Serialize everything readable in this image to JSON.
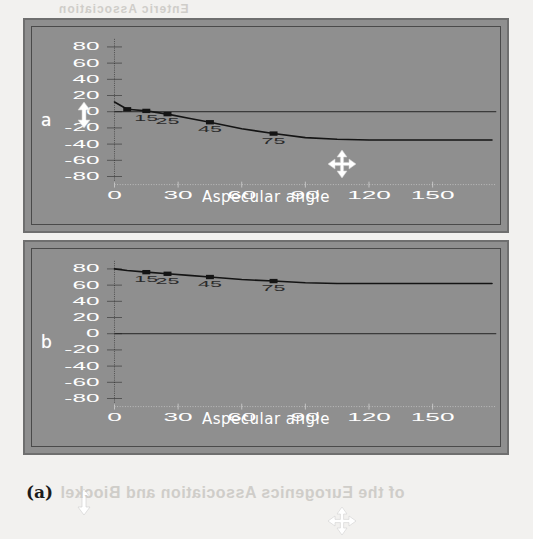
{
  "caption": "(a)",
  "bleed_through": {
    "top": "Enteric Association",
    "bottom": "of the Eurogenics Association and Biockel"
  },
  "panels": [
    {
      "id": "a",
      "letter": "a",
      "cursor_vertical": "move-cursor",
      "cursor_marker": "move-cursor"
    },
    {
      "id": "b",
      "letter": "b",
      "cursor_vertical": "move-cursor",
      "cursor_marker": "move-cursor"
    }
  ],
  "chart_data": [
    {
      "type": "line",
      "title": "",
      "panel": "a",
      "xlabel": "Aspecular  angle",
      "ylabel": "",
      "xlim": [
        -8,
        180
      ],
      "ylim": [
        -90,
        90
      ],
      "xticks": [
        0,
        30,
        60,
        90,
        120,
        150
      ],
      "yticks": [
        80,
        60,
        40,
        20,
        0,
        -20,
        -40,
        -60,
        -80
      ],
      "grid": false,
      "legend": "none",
      "reference_line_y": 0,
      "series": [
        {
          "name": "curve-a",
          "x": [
            0,
            6,
            15,
            25,
            35,
            45,
            60,
            75,
            90,
            105,
            120,
            140,
            160,
            178
          ],
          "y": [
            12,
            3,
            1,
            -3,
            -8,
            -13,
            -21,
            -27,
            -32,
            -34,
            -35,
            -35,
            -35,
            -35
          ]
        }
      ],
      "markers": [
        {
          "label": "",
          "x": 6,
          "y": 3
        },
        {
          "label": "15",
          "x": 15,
          "y": 1
        },
        {
          "label": "25",
          "x": 25,
          "y": -3
        },
        {
          "label": "45",
          "x": 45,
          "y": -13
        },
        {
          "label": "75",
          "x": 75,
          "y": -27
        }
      ]
    },
    {
      "type": "line",
      "title": "",
      "panel": "b",
      "xlabel": "Aspecular  angle",
      "ylabel": "",
      "xlim": [
        -8,
        180
      ],
      "ylim": [
        -90,
        90
      ],
      "xticks": [
        0,
        30,
        60,
        90,
        120,
        150
      ],
      "yticks": [
        80,
        60,
        40,
        20,
        0,
        -20,
        -40,
        -60,
        -80
      ],
      "grid": false,
      "legend": "none",
      "reference_line_y": 0,
      "series": [
        {
          "name": "curve-b",
          "x": [
            0,
            6,
            15,
            25,
            35,
            45,
            60,
            75,
            90,
            105,
            120,
            140,
            160,
            178
          ],
          "y": [
            80,
            78,
            76,
            74,
            72,
            70,
            67,
            65,
            63,
            62,
            62,
            62,
            62,
            62
          ]
        }
      ],
      "markers": [
        {
          "label": "15",
          "x": 15,
          "y": 76
        },
        {
          "label": "25",
          "x": 25,
          "y": 74
        },
        {
          "label": "45",
          "x": 45,
          "y": 70
        },
        {
          "label": "75",
          "x": 75,
          "y": 65
        }
      ]
    }
  ],
  "colors": {
    "page": "#f2f1ef",
    "panel_bg": "#8f8f8f",
    "panel_border": "#6f6f6f",
    "plot_frame": "#4a4a4a",
    "curve": "#141414",
    "tick_text": "#ffffff",
    "cursor": "#ffffff"
  }
}
